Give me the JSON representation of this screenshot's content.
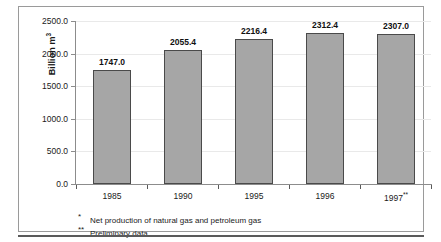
{
  "chart_data": {
    "type": "bar",
    "title": "",
    "subtitle": "",
    "xlabel": "",
    "ylabel": "Billion m3",
    "ylabel_display": "Billion m",
    "ylabel_superscript": "3",
    "categories": [
      "1985",
      "1990",
      "1995",
      "1996",
      "1997**"
    ],
    "category_labels": [
      {
        "text": "1985",
        "note": ""
      },
      {
        "text": "1990",
        "note": ""
      },
      {
        "text": "1995",
        "note": ""
      },
      {
        "text": "1996",
        "note": ""
      },
      {
        "text": "1997",
        "note": "**"
      }
    ],
    "values": [
      1747.0,
      2055.4,
      2216.4,
      2312.4,
      2307.0
    ],
    "value_labels": [
      "1747.0",
      "2055.4",
      "2216.4",
      "2312.4",
      "2307.0"
    ],
    "ylim": [
      0,
      2500
    ],
    "ytick_values": [
      0,
      500,
      1000,
      1500,
      2000,
      2500
    ],
    "ytick_labels": [
      "0.0",
      "500.0",
      "1000.0",
      "1500.0",
      "2000.0",
      "2500.0"
    ],
    "grid": true,
    "legend": "none",
    "bar_color": "#a6a6a6",
    "bar_border_color": "#4a4a4a",
    "axis_color": "#8c8c8c",
    "text_color": "#1a1a1a"
  },
  "footnotes": [
    {
      "mark": "*",
      "text": "Net production of natural gas and petroleum gas"
    },
    {
      "mark": "**",
      "text": "Preliminary data"
    }
  ]
}
